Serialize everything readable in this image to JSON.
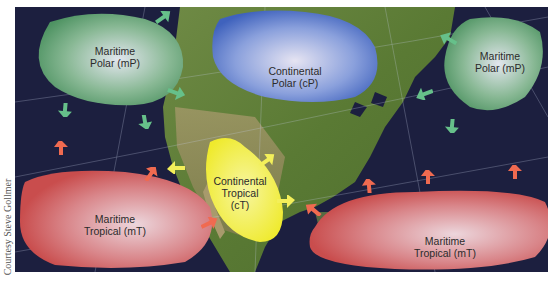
{
  "figure": {
    "credit": "Courtesy Steve Gollmer"
  },
  "air_masses": [
    {
      "id": "mP-west",
      "line1": "Maritime",
      "line2": "Polar (mP)",
      "line3": "",
      "type": "maritime-polar",
      "color": "#5aa06e"
    },
    {
      "id": "cP",
      "line1": "Continental",
      "line2": "Polar (cP)",
      "line3": "",
      "type": "continental-polar",
      "color": "#4a6fc4"
    },
    {
      "id": "mP-east",
      "line1": "Maritime",
      "line2": "Polar (mP)",
      "line3": "",
      "type": "maritime-polar",
      "color": "#5aa06e"
    },
    {
      "id": "cT",
      "line1": "Continental",
      "line2": "Tropical",
      "line3": "(cT)",
      "type": "continental-tropical",
      "color": "#f0ec3a"
    },
    {
      "id": "mT-west",
      "line1": "Maritime",
      "line2": "Tropical (mT)",
      "line3": "",
      "type": "maritime-tropical",
      "color": "#d65a5a"
    },
    {
      "id": "mT-east",
      "line1": "Maritime",
      "line2": "Tropical (mT)",
      "line3": "",
      "type": "maritime-tropical",
      "color": "#d65a5a"
    }
  ],
  "colors": {
    "ocean": "#1c1f3f",
    "land": "#5d7a38",
    "mP_arrow": "#66c08a",
    "mT_arrow": "#f06a50",
    "cT_arrow": "#f3ef5a"
  }
}
